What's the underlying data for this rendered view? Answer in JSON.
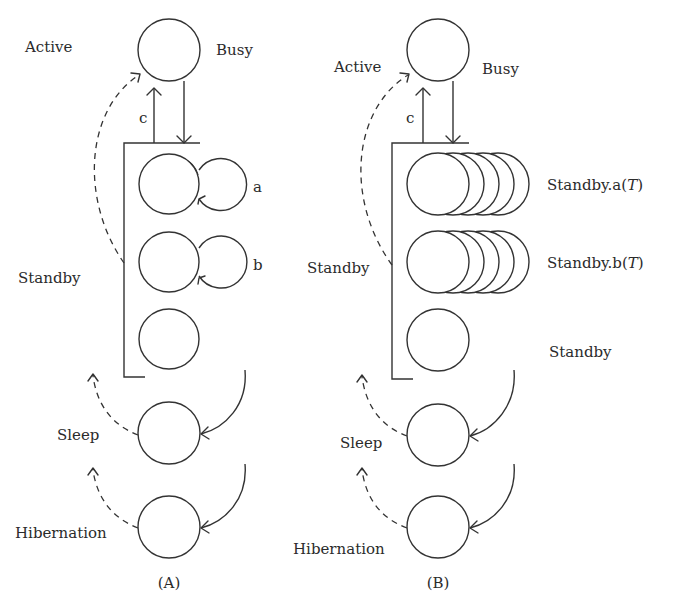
{
  "panels": [
    {
      "id": "A",
      "caption": "(A)",
      "states": {
        "active_label": "Active",
        "busy_label": "Busy",
        "transition_label": "c",
        "standby_label": "Standby",
        "sleep_label": "Sleep",
        "hibernation_label": "Hibernation",
        "loop_a_label": "a",
        "loop_b_label": "b"
      }
    },
    {
      "id": "B",
      "caption": "(B)",
      "states": {
        "active_label": "Active",
        "busy_label": "Busy",
        "transition_label": "c",
        "standby_label": "Standby",
        "sleep_label": "Sleep",
        "hibernation_label": "Hibernation",
        "standby_a_prefix": "Standby.a(",
        "standby_b_prefix": "Standby.b(",
        "time_var": "T",
        "suffix": ")",
        "standby_plain_label": "Standby"
      }
    }
  ],
  "style": {
    "stroke_color": "#333333",
    "text_color": "#2b2b2b",
    "background": "#ffffff"
  }
}
